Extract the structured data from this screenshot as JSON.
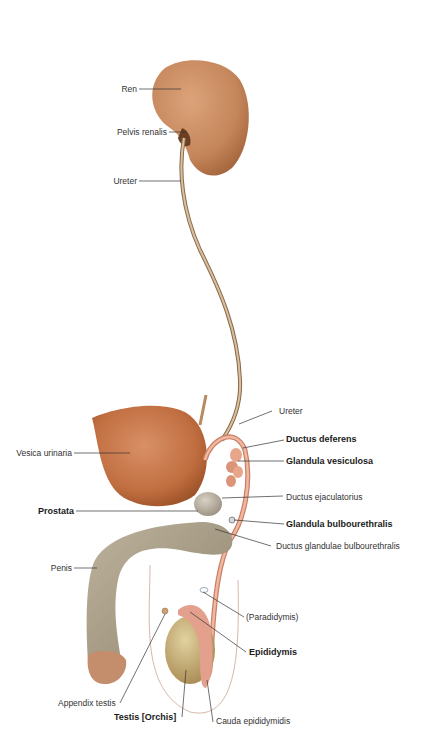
{
  "diagram": {
    "colors": {
      "kidney": "#c98a5c",
      "bladder": "#c9784a",
      "ureter": "#c4a98a",
      "penis": "#a89c86",
      "testis": "#c9b27a",
      "duct": "#e0a48c",
      "leader": "#333333"
    },
    "labels": [
      {
        "id": "ren",
        "text": "Ren",
        "bold": false
      },
      {
        "id": "pelvis-renalis",
        "text": "Pelvis renalis",
        "bold": false
      },
      {
        "id": "ureter-upper",
        "text": "Ureter",
        "bold": false
      },
      {
        "id": "ureter-lower",
        "text": "Ureter",
        "bold": false
      },
      {
        "id": "ductus-deferens",
        "text": "Ductus deferens",
        "bold": true
      },
      {
        "id": "vesica-urinaria",
        "text": "Vesica urinaria",
        "bold": false
      },
      {
        "id": "glandula-vesiculosa",
        "text": "Glandula vesiculosa",
        "bold": true
      },
      {
        "id": "ductus-ejaculatorius",
        "text": "Ductus ejaculatorius",
        "bold": false
      },
      {
        "id": "prostata",
        "text": "Prostata",
        "bold": true
      },
      {
        "id": "glandula-bulbourethralis",
        "text": "Glandula bulbourethralis",
        "bold": true
      },
      {
        "id": "ductus-glandulae-bulbourethralis",
        "text": "Ductus glandulae bulbourethralis",
        "bold": false
      },
      {
        "id": "penis",
        "text": "Penis",
        "bold": false
      },
      {
        "id": "paradidymis",
        "text": "(Paradidymis)",
        "bold": false
      },
      {
        "id": "epididymis",
        "text": "Epididymis",
        "bold": true
      },
      {
        "id": "appendix-testis",
        "text": "Appendix testis",
        "bold": false
      },
      {
        "id": "testis",
        "text": "Testis [Orchis]",
        "bold": true
      },
      {
        "id": "cauda-epididymidis",
        "text": "Cauda epididymidis",
        "bold": false
      }
    ]
  }
}
